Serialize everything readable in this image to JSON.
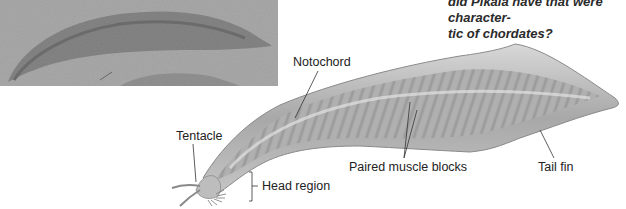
{
  "figure": {
    "photo_caption": "Pikaia fossil photograph",
    "question": {
      "line1": "did Pikaia have that were character-",
      "line2": "tic of chordates?"
    },
    "labels": {
      "notochord": "Notochord",
      "tentacle": "Tentacle",
      "head_region": "Head region",
      "paired_muscle_blocks": "Paired muscle blocks",
      "tail_fin": "Tail fin"
    },
    "colors": {
      "background": "#ffffff",
      "body_fill": "#b4b4b4",
      "label_text": "#222222",
      "leader_line": "#333333"
    }
  }
}
